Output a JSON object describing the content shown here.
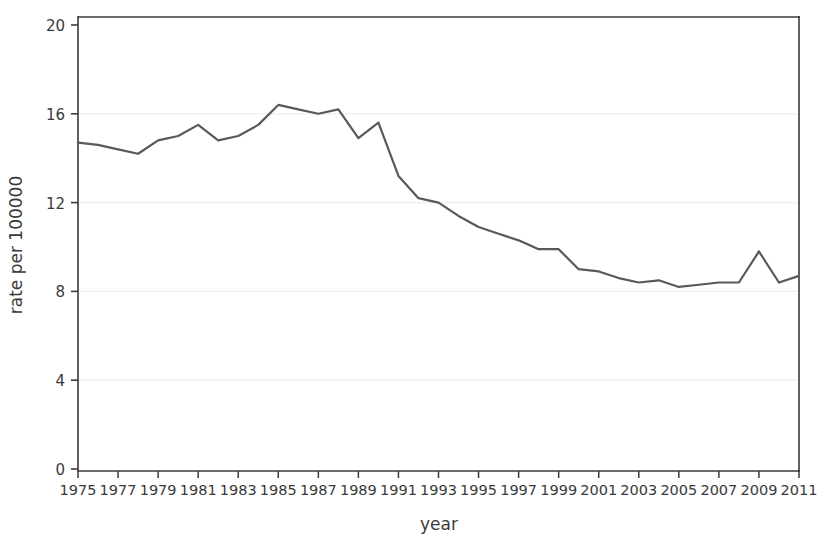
{
  "chart_data": {
    "type": "line",
    "title": "",
    "xlabel": "year",
    "ylabel": "rate per 100000",
    "xlim": [
      1975,
      2011
    ],
    "ylim": [
      0,
      20
    ],
    "yticks": [
      0,
      4,
      8,
      12,
      16,
      20
    ],
    "ytick_labels": [
      "0",
      "4",
      "8",
      "12",
      "16",
      "20"
    ],
    "xticks": [
      1975,
      1977,
      1979,
      1981,
      1983,
      1985,
      1987,
      1989,
      1991,
      1993,
      1995,
      1997,
      1999,
      2001,
      2003,
      2005,
      2007,
      2009,
      2011
    ],
    "xtick_labels": [
      "1975",
      "1977",
      "1979",
      "1981",
      "1983",
      "1985",
      "1987",
      "1989",
      "1991",
      "1993",
      "1995",
      "1997",
      "1999",
      "2001",
      "2003",
      "2005",
      "2007",
      "2009",
      "2011"
    ],
    "grid": true,
    "grid_axis": "y",
    "legend": "none",
    "line_color": "#595959",
    "line_width": 2.2,
    "x": [
      1975,
      1976,
      1977,
      1978,
      1979,
      1980,
      1981,
      1982,
      1983,
      1984,
      1985,
      1986,
      1987,
      1988,
      1989,
      1990,
      1991,
      1992,
      1993,
      1994,
      1995,
      1996,
      1997,
      1998,
      1999,
      2000,
      2001,
      2002,
      2003,
      2004,
      2005,
      2006,
      2007,
      2008,
      2009,
      2010,
      2011
    ],
    "values": [
      14.7,
      14.6,
      14.4,
      14.2,
      14.8,
      15.0,
      15.5,
      14.8,
      15.0,
      15.5,
      16.4,
      16.2,
      16.0,
      16.2,
      14.9,
      15.6,
      13.2,
      12.2,
      12.0,
      11.4,
      10.9,
      10.6,
      10.3,
      9.9,
      9.9,
      9.0,
      8.9,
      8.6,
      8.4,
      8.5,
      8.2,
      8.3,
      8.4,
      8.4,
      9.8,
      8.4,
      8.7
    ]
  },
  "axis": {
    "ylabel": "rate per 100000",
    "xlabel": "year"
  }
}
